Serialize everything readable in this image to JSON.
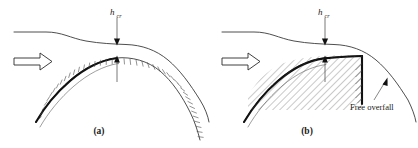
{
  "figure": {
    "kind": "hydraulics-diagram",
    "background_color": "#ffffff",
    "line_color": "#3a3a3a",
    "hatch_color": "#4a4a4a",
    "text_color": "#1a1a1a"
  },
  "panels": [
    {
      "id": "a",
      "caption": "(a)",
      "depth_label": "h",
      "depth_subscript": "cr",
      "flow_arrow": "flow-direction-arrow",
      "features": [
        "water-surface-profile",
        "weir-crest-curve",
        "hatched-weir-body",
        "critical-depth-dimension"
      ]
    },
    {
      "id": "b",
      "caption": "(b)",
      "depth_label": "h",
      "depth_subscript": "cr",
      "flow_arrow": "flow-direction-arrow",
      "annotation": "Free overfall",
      "features": [
        "water-surface-profile",
        "weir-crest-curve",
        "hatched-weir-body",
        "vertical-drop-face",
        "critical-depth-dimension",
        "free-overfall-nappe",
        "annotation-leader-arrow"
      ]
    }
  ]
}
